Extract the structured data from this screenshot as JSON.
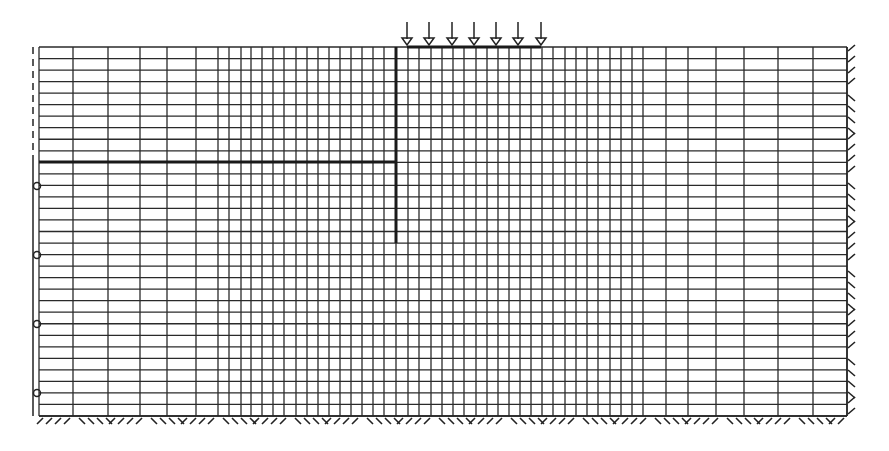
{
  "diagram": {
    "type": "finite-element-mesh",
    "colors": {
      "line": "#2a2a2a",
      "background": "#ffffff"
    },
    "mesh": {
      "left": 39,
      "right": 847,
      "top": 47,
      "bottom": 416,
      "x_lines": [
        39,
        73,
        108,
        140,
        167,
        196,
        218,
        229,
        241,
        251,
        262,
        273,
        284,
        296,
        307,
        318,
        329,
        340,
        351,
        362,
        373,
        384,
        396,
        408,
        419,
        431,
        442,
        453,
        464,
        476,
        487,
        498,
        509,
        520,
        531,
        542,
        553,
        565,
        576,
        587,
        598,
        610,
        621,
        632,
        643,
        666,
        688,
        716,
        744,
        778,
        813,
        847
      ],
      "row_count": 32
    },
    "wall": {
      "x": 396,
      "y_top": 47,
      "y_bottom": 243,
      "label": "retaining-wall"
    },
    "excavation_level": {
      "y": 162,
      "x_start": 39,
      "x_end": 396,
      "label": "excavation-level"
    },
    "strip_load": {
      "arrow_x": [
        407,
        429,
        452,
        474,
        496,
        518,
        541
      ],
      "arrow_top": 22,
      "y": 47,
      "label": "surface-load"
    },
    "left_boundary": {
      "x": 33,
      "dashed_y": [
        47,
        162
      ],
      "solid_y": [
        162,
        416
      ],
      "roller_y": [
        186,
        255,
        324,
        393
      ],
      "label": "roller-support"
    },
    "bottom_boundary": {
      "y": 416,
      "label": "fixed-support"
    },
    "right_boundary": {
      "x": 847,
      "label": "fixed-support"
    }
  }
}
